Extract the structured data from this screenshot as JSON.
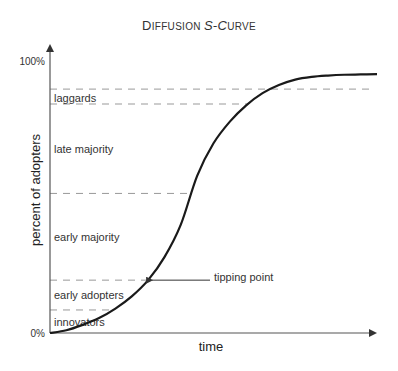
{
  "chart_data": {
    "type": "line",
    "title": "Diffusion S-Curve",
    "title_display": {
      "cap1": "D",
      "small1": "IFFUSION ",
      "cap2": "S-C",
      "small2": "URVE"
    },
    "xlabel": "time",
    "ylabel": "percent of adopters",
    "ylim": [
      0,
      100
    ],
    "y_ticks": [
      "0%",
      "100%"
    ],
    "grid": false,
    "series": [
      {
        "name": "adoption",
        "x": [
          0,
          5,
          10,
          15,
          20,
          25,
          30,
          35,
          40,
          45,
          50,
          55,
          60,
          65,
          70,
          75,
          80,
          85,
          90,
          95,
          100
        ],
        "y": [
          0,
          1,
          3,
          5.5,
          9,
          13.5,
          19.5,
          28,
          40,
          58,
          70,
          78,
          84,
          88.5,
          91.5,
          93.5,
          94.5,
          95,
          95.3,
          95.4,
          95.5
        ]
      }
    ],
    "segments": [
      {
        "name": "innovators",
        "label": "innovators",
        "upper_pct": 8.5
      },
      {
        "name": "early-adopters",
        "label": "early adopters",
        "upper_pct": 19.5
      },
      {
        "name": "early-majority",
        "label": "early majority",
        "upper_pct": 51.5
      },
      {
        "name": "late-majority",
        "label": "late majority",
        "upper_pct": 84.5
      },
      {
        "name": "laggards",
        "label": "laggards",
        "upper_pct": 90
      }
    ],
    "annotations": [
      {
        "name": "tipping-point",
        "text": "tipping point",
        "x": 41,
        "y": 19.5
      }
    ]
  }
}
